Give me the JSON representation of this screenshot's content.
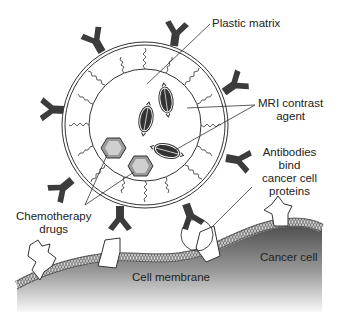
{
  "diagram": {
    "labels": {
      "plastic_matrix": "Plastic matrix",
      "mri_line1": "MRI contrast",
      "mri_line2": "agent",
      "antibodies_line1": "Antibodies",
      "antibodies_line2": "bind",
      "antibodies_line3": "cancer cell",
      "antibodies_line4": "proteins",
      "chemo_line1": "Chemotherapy",
      "chemo_line2": "drugs",
      "cell_membrane": "Cell membrane",
      "cancer_cell": "Cancer cell"
    },
    "colors": {
      "antibody": "#3c3c3c",
      "outline": "#333333",
      "drug_fill": "#b8b8b8",
      "cell_dark": "#555555",
      "cell_light": "#f4f4f4"
    }
  }
}
